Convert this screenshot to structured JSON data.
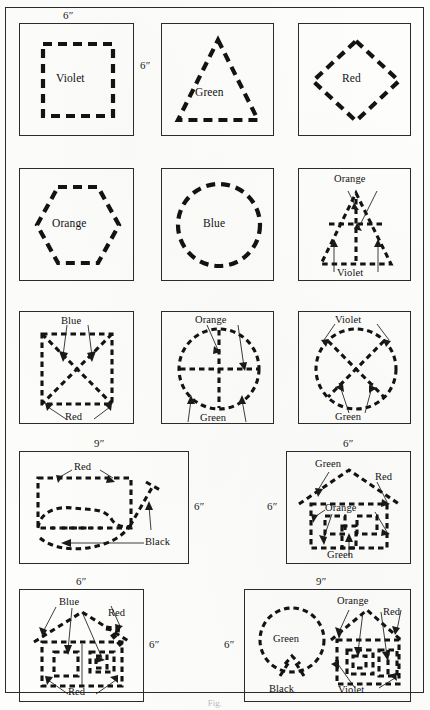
{
  "plate": {
    "title_mark": "Fig.",
    "figures": [
      {
        "id": "fig-1",
        "shape": "square",
        "color_label": "Violet",
        "dim_top": "6″",
        "dim_right": "6″"
      },
      {
        "id": "fig-2",
        "shape": "triangle",
        "color_label": "Green"
      },
      {
        "id": "fig-3",
        "shape": "diamond",
        "color_label": "Red"
      },
      {
        "id": "fig-4",
        "shape": "hexagon",
        "color_label": "Orange"
      },
      {
        "id": "fig-5",
        "shape": "circle",
        "color_label": "Blue"
      },
      {
        "id": "fig-6",
        "shape": "triangle-with-cross",
        "labels": [
          "Orange",
          "Violet"
        ]
      },
      {
        "id": "fig-7",
        "shape": "square-with-x",
        "labels": [
          "Blue",
          "Red"
        ]
      },
      {
        "id": "fig-8",
        "shape": "circle-with-cross",
        "labels": [
          "Orange",
          "Green"
        ]
      },
      {
        "id": "fig-9",
        "shape": "circle-with-x",
        "labels": [
          "Violet",
          "Green"
        ]
      },
      {
        "id": "fig-10",
        "shape": "rectangle-with-cat",
        "labels": [
          "Red",
          "Black"
        ],
        "dim_top": "9″",
        "dim_right": "6″"
      },
      {
        "id": "fig-11",
        "shape": "house",
        "labels": [
          "Green",
          "Red",
          "Orange",
          "Green"
        ],
        "dim_top": "6″",
        "dim_left": "6″"
      },
      {
        "id": "fig-12",
        "shape": "house-variant",
        "labels": [
          "Blue",
          "Red",
          "Red"
        ],
        "dim_top": "6″",
        "dim_right": "6″"
      },
      {
        "id": "fig-13",
        "shape": "cat-and-house",
        "labels": [
          "Orange",
          "Red",
          "Green",
          "Black",
          "Violet"
        ],
        "dim_top": "9″",
        "dim_left": "6″"
      }
    ]
  }
}
